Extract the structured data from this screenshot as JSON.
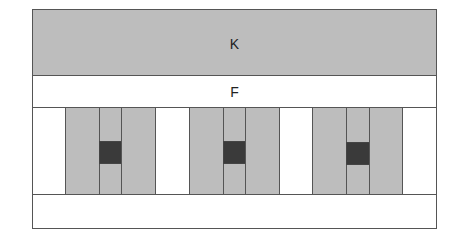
{
  "diagram": {
    "top_block": {
      "label": "K",
      "fill": "#bdbdbd"
    },
    "middle_strip": {
      "label": "F",
      "fill": "#ffffff"
    },
    "bottom_strip": {
      "label": "",
      "fill": "#ffffff"
    },
    "column_row": {
      "cells": [
        {
          "type": "white",
          "x": 32,
          "w": 34
        },
        {
          "type": "gray",
          "x": 65,
          "w": 35
        },
        {
          "type": "narrow-gray-with-dark",
          "x": 99,
          "w": 23
        },
        {
          "type": "gray",
          "x": 121,
          "w": 35
        },
        {
          "type": "white",
          "x": 155,
          "w": 35
        },
        {
          "type": "gray",
          "x": 189,
          "w": 35
        },
        {
          "type": "narrow-gray-with-dark",
          "x": 223,
          "w": 23
        },
        {
          "type": "gray",
          "x": 245,
          "w": 35
        },
        {
          "type": "white",
          "x": 279,
          "w": 34
        },
        {
          "type": "gray",
          "x": 312,
          "w": 35
        },
        {
          "type": "narrow-gray-with-dark",
          "x": 346,
          "w": 24
        },
        {
          "type": "gray",
          "x": 369,
          "w": 34
        },
        {
          "type": "white",
          "x": 402,
          "w": 35
        }
      ],
      "groups": 3,
      "dark_square_fill": "#3a3a3a"
    },
    "colors": {
      "gray": "#bdbdbd",
      "dark": "#3a3a3a",
      "border": "#555555"
    }
  }
}
